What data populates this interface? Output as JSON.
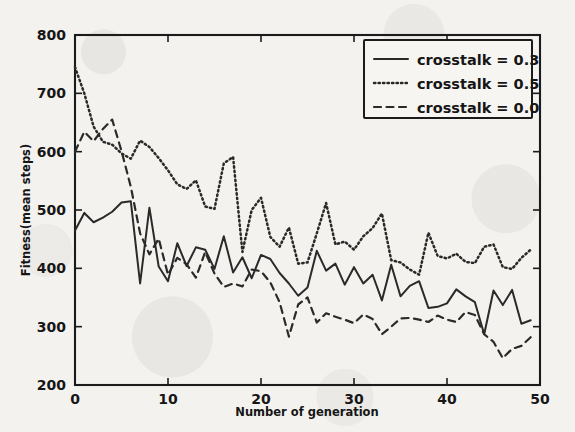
{
  "figure": {
    "background_color": "#f4f2ef",
    "ink_color": "#1b1b1b"
  },
  "chart_data": {
    "type": "line",
    "title": "",
    "xlabel": "Number of generation",
    "ylabel": "Fitness(mean steps)",
    "xlim": [
      0,
      50
    ],
    "ylim": [
      200,
      800
    ],
    "xticks": [
      0,
      10,
      20,
      30,
      40,
      50
    ],
    "xtick_labels": [
      "0",
      "10",
      "20",
      "30",
      "40",
      "50"
    ],
    "yticks": [
      200,
      300,
      400,
      500,
      600,
      700,
      800
    ],
    "ytick_labels": [
      "200",
      "300",
      "400",
      "500",
      "600",
      "700",
      "800"
    ],
    "grid": false,
    "legend_position": "upper right",
    "x": [
      0,
      1,
      2,
      3,
      4,
      5,
      6,
      7,
      8,
      9,
      10,
      11,
      12,
      13,
      14,
      15,
      16,
      17,
      18,
      19,
      20,
      21,
      22,
      23,
      24,
      25,
      26,
      27,
      28,
      29,
      30,
      31,
      32,
      33,
      34,
      35,
      36,
      37,
      38,
      39,
      40,
      41,
      42,
      43,
      44,
      45,
      46,
      47,
      48,
      49
    ],
    "series": [
      {
        "name": "crosstalk = 0.3",
        "style": "solid",
        "color": "#2a2a2a",
        "values": [
          465,
          495,
          479,
          487,
          497,
          513,
          515,
          374,
          504,
          403,
          378,
          443,
          404,
          436,
          432,
          399,
          455,
          393,
          419,
          383,
          423,
          416,
          392,
          374,
          353,
          367,
          430,
          396,
          408,
          372,
          402,
          374,
          389,
          345,
          406,
          352,
          370,
          378,
          332,
          334,
          340,
          364,
          352,
          342,
          287,
          362,
          337,
          363,
          305,
          311
        ]
      },
      {
        "name": "crosstalk = 0.5",
        "style": "dotted",
        "color": "#2a2a2a",
        "values": [
          745,
          700,
          643,
          617,
          612,
          597,
          588,
          619,
          608,
          589,
          568,
          544,
          536,
          551,
          506,
          502,
          580,
          591,
          428,
          500,
          521,
          454,
          437,
          470,
          408,
          410,
          460,
          512,
          441,
          446,
          432,
          455,
          469,
          494,
          414,
          410,
          398,
          389,
          461,
          421,
          417,
          425,
          411,
          409,
          437,
          441,
          402,
          399,
          418,
          432
        ]
      },
      {
        "name": "crosstalk = 0.0",
        "style": "dashed",
        "color": "#2a2a2a",
        "values": [
          600,
          634,
          618,
          639,
          655,
          601,
          540,
          460,
          424,
          451,
          389,
          418,
          407,
          384,
          428,
          391,
          368,
          374,
          369,
          398,
          395,
          376,
          342,
          283,
          338,
          350,
          307,
          323,
          317,
          312,
          306,
          321,
          313,
          287,
          300,
          314,
          315,
          312,
          308,
          319,
          312,
          308,
          325,
          320,
          287,
          274,
          246,
          262,
          267,
          282
        ]
      }
    ],
    "legend_entries": [
      {
        "label": "crosstalk = 0.3",
        "style": "solid"
      },
      {
        "label": "crosstalk = 0.5",
        "style": "dotted"
      },
      {
        "label": "crosstalk = 0.0",
        "style": "dashed"
      }
    ]
  }
}
